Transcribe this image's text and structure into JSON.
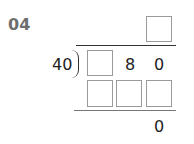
{
  "problem": {
    "number": "04",
    "divisor": "40",
    "dividend_digits": [
      "",
      "8",
      "0"
    ],
    "quotient_boxes": 1,
    "product_boxes": 3,
    "remainder": "0"
  }
}
